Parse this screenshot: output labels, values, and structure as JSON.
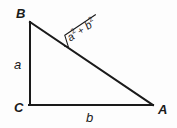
{
  "figure": {
    "type": "right-triangle-diagram",
    "background_color": "#fdfdfd",
    "stroke_color": "#1a1a1a",
    "vertices": {
      "apex_top_left": {
        "label": "B",
        "x": 30,
        "y": 22
      },
      "right_angle_bottom_left": {
        "label": "C",
        "x": 30,
        "y": 105
      },
      "bottom_right": {
        "label": "A",
        "x": 152,
        "y": 105
      }
    },
    "vertex_labels": {
      "b_label": "B",
      "c_label": "C",
      "a_label": "A"
    },
    "side_labels": {
      "vertical_leg": "a",
      "horizontal_leg": "b"
    },
    "hypotenuse_label": {
      "radical_sign": "√",
      "term_one_base": "a",
      "term_one_exponent": "2",
      "operator": "+",
      "term_two_base": "b",
      "term_two_exponent": "2",
      "full_expression": "√(a² + b²)",
      "rotation_degrees": -34
    }
  }
}
